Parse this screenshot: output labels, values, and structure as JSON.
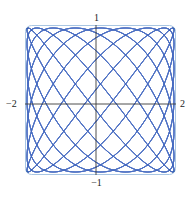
{
  "figure": {
    "title": "",
    "background_color": "#ffffff",
    "width": 193,
    "height": 198
  },
  "frame": {
    "border_color": "#a9c6e3",
    "fill_color": "#ffffff",
    "corner_radius": 6,
    "x_px": 25,
    "y_px": 25,
    "width_px": 151,
    "height_px": 150
  },
  "axes": {
    "color": "#3a3a3a",
    "x_axis_y_px": 104,
    "y_axis_x_px": 96,
    "labels": {
      "top": "1",
      "bottom": "−1",
      "left": "−2",
      "right": "2"
    }
  },
  "curve": {
    "color": "#4a6fc4",
    "line_width": 0.45,
    "opacity": 0.85
  },
  "chart_data": {
    "type": "line",
    "title": "",
    "xlabel": "",
    "ylabel": "",
    "xlim": [
      -2,
      2
    ],
    "ylim": [
      -1,
      1
    ],
    "grid": false,
    "legend": null,
    "xticks": [
      -2,
      2
    ],
    "xticklabels": [
      "−2",
      "2"
    ],
    "yticks": [
      -1,
      1
    ],
    "yticklabels": [
      "−1",
      "1"
    ],
    "parametric": {
      "x_expression": "2*sin(a*t)",
      "y_expression": "cos(b*t)",
      "a": 7,
      "b": 9,
      "t_range": [
        0,
        6.283185307179586
      ],
      "samples": 4000,
      "family_count": 9,
      "phase_step": 0.3490658503988659
    },
    "series": [
      {
        "name": "lissajous-family",
        "a": 7,
        "b": 9,
        "phases": [
          0.0,
          0.349,
          0.698,
          1.047,
          1.396,
          1.745,
          2.094,
          2.443,
          2.793
        ]
      }
    ]
  }
}
